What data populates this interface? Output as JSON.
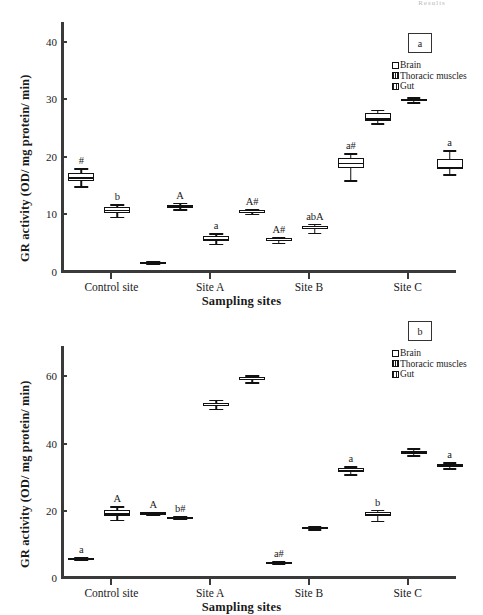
{
  "figure": {
    "top_note": "Results"
  },
  "axes": {
    "y_title": "GR activity (OD/ mg protein/ min)",
    "x_title": "Sampling sites",
    "x_categories": [
      "Control site",
      "Site A",
      "Site B",
      "Site C"
    ]
  },
  "legend": {
    "entries": [
      {
        "label": "Brain",
        "pattern": "open-white"
      },
      {
        "label": "Thoracic muscles",
        "pattern": "fine-vertical-hatch"
      },
      {
        "label": "Gut",
        "pattern": "dense-vertical-hatch"
      }
    ]
  },
  "chart_data": [
    {
      "type": "box",
      "panel_tag": "a",
      "title": "",
      "xlabel": "Sampling sites",
      "ylabel": "GR activity (OD/ mg protein/ min)",
      "categories": [
        "Control site",
        "Site A",
        "Site B",
        "Site C"
      ],
      "ylim": [
        0,
        42
      ],
      "yticks": [
        0,
        10,
        20,
        30,
        40
      ],
      "grid": false,
      "legend_position": "top-right",
      "series": [
        {
          "name": "Brain",
          "boxes": [
            {
              "category": "Control site",
              "min": 14.9,
              "q1": 15.8,
              "median": 16.5,
              "q3": 17.2,
              "max": 18.0,
              "annotation": "#"
            },
            {
              "category": "Site A",
              "min": 10.9,
              "q1": 11.2,
              "median": 11.4,
              "q3": 11.7,
              "max": 12.0,
              "annotation": "A"
            },
            {
              "category": "Site B",
              "min": 5.1,
              "q1": 5.4,
              "median": 5.6,
              "q3": 5.9,
              "max": 6.1,
              "annotation": "A#"
            },
            {
              "category": "Site C",
              "min": 25.8,
              "q1": 26.2,
              "median": 26.7,
              "q3": 27.6,
              "max": 28.2,
              "annotation": ""
            }
          ]
        },
        {
          "name": "Thoracic muscles",
          "boxes": [
            {
              "category": "Control site",
              "min": 9.6,
              "q1": 10.3,
              "median": 10.8,
              "q3": 11.2,
              "max": 11.8,
              "annotation": "b"
            },
            {
              "category": "Site A",
              "min": 4.9,
              "q1": 5.4,
              "median": 5.8,
              "q3": 6.2,
              "max": 6.7,
              "annotation": "a"
            },
            {
              "category": "Site B",
              "min": 6.8,
              "q1": 7.4,
              "median": 7.7,
              "q3": 8.0,
              "max": 8.4,
              "annotation": "abA"
            },
            {
              "category": "Site C",
              "min": 29.5,
              "q1": 29.8,
              "median": 29.9,
              "q3": 30.1,
              "max": 30.3,
              "annotation": ""
            }
          ]
        },
        {
          "name": "Gut",
          "boxes": [
            {
              "category": "Control site",
              "min": 1.5,
              "q1": 1.6,
              "median": 1.7,
              "q3": 1.8,
              "max": 1.9,
              "annotation": ""
            },
            {
              "category": "Site A",
              "min": 10.1,
              "q1": 10.4,
              "median": 10.5,
              "q3": 10.7,
              "max": 11.0,
              "annotation": "A#"
            },
            {
              "category": "Site B",
              "min": 15.9,
              "q1": 18.0,
              "median": 19.0,
              "q3": 19.7,
              "max": 20.6,
              "annotation": "a#"
            },
            {
              "category": "Site C",
              "min": 17.0,
              "q1": 17.9,
              "median": 18.3,
              "q3": 19.6,
              "max": 21.1,
              "annotation": "a"
            }
          ]
        }
      ]
    },
    {
      "type": "box",
      "panel_tag": "b",
      "title": "",
      "xlabel": "Sampling sites",
      "ylabel": "GR activity (OD/ mg protein/ min)",
      "categories": [
        "Control site",
        "Site A",
        "Site B",
        "Site C"
      ],
      "ylim": [
        0,
        72
      ],
      "yticks": [
        0,
        20,
        40,
        60
      ],
      "grid": false,
      "legend_position": "top-right",
      "series": [
        {
          "name": "Brain",
          "boxes": [
            {
              "category": "Control site",
              "min": 5.4,
              "q1": 5.6,
              "median": 5.8,
              "q3": 6.0,
              "max": 6.2,
              "annotation": "a"
            },
            {
              "category": "Site A",
              "min": 17.7,
              "q1": 17.9,
              "median": 18.0,
              "q3": 18.2,
              "max": 18.4,
              "annotation": "b#"
            },
            {
              "category": "Site B",
              "min": 4.4,
              "q1": 4.6,
              "median": 4.7,
              "q3": 4.9,
              "max": 5.1,
              "annotation": "a#"
            },
            {
              "category": "Site C",
              "min": 17.1,
              "q1": 18.3,
              "median": 18.9,
              "q3": 19.6,
              "max": 20.3,
              "annotation": "b"
            }
          ]
        },
        {
          "name": "Thoracic muscles",
          "boxes": [
            {
              "category": "Control site",
              "min": 17.4,
              "q1": 18.4,
              "median": 19.2,
              "q3": 20.1,
              "max": 21.4,
              "annotation": "A"
            },
            {
              "category": "Site A",
              "min": 50.4,
              "q1": 51.2,
              "median": 51.6,
              "q3": 52.2,
              "max": 53.0,
              "annotation": ""
            },
            {
              "category": "Site B",
              "min": 14.5,
              "q1": 14.8,
              "median": 15.0,
              "q3": 15.3,
              "max": 15.6,
              "annotation": ""
            },
            {
              "category": "Site C",
              "min": 36.5,
              "q1": 37.1,
              "median": 37.5,
              "q3": 37.9,
              "max": 38.6,
              "annotation": ""
            }
          ]
        },
        {
          "name": "Gut",
          "boxes": [
            {
              "category": "Control site",
              "min": 19.0,
              "q1": 19.2,
              "median": 19.3,
              "q3": 19.5,
              "max": 19.7,
              "annotation": "A"
            },
            {
              "category": "Site A",
              "min": 58.3,
              "q1": 59.0,
              "median": 59.3,
              "q3": 59.7,
              "max": 60.3,
              "annotation": ""
            },
            {
              "category": "Site B",
              "min": 30.8,
              "q1": 31.5,
              "median": 32.0,
              "q3": 32.6,
              "max": 33.3,
              "annotation": "a"
            },
            {
              "category": "Site C",
              "min": 32.6,
              "q1": 33.2,
              "median": 33.5,
              "q3": 33.9,
              "max": 34.5,
              "annotation": "a"
            }
          ]
        }
      ]
    }
  ]
}
